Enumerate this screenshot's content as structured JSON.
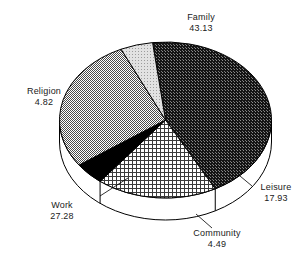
{
  "chart_data": {
    "type": "pie",
    "title": "",
    "subtitle": "",
    "xlabel": "",
    "ylabel": "",
    "legend_position": "none",
    "grid": false,
    "three_d": true,
    "labels_outside": true,
    "categories": [
      "Family",
      "Leisure",
      "Community",
      "Work",
      "Religion"
    ],
    "values": [
      43.13,
      17.93,
      4.49,
      27.28,
      4.82
    ],
    "slices": [
      {
        "label": "Family",
        "value": 43.13,
        "value_text": "43.13",
        "fill": "dark-dotted",
        "color": "#1c1c1c"
      },
      {
        "label": "Leisure",
        "value": 17.93,
        "value_text": "17.93",
        "fill": "fine-crosshatch",
        "color": "#ffffff"
      },
      {
        "label": "Community",
        "value": 4.49,
        "value_text": "4.49",
        "fill": "solid-black",
        "color": "#000000"
      },
      {
        "label": "Work",
        "value": 27.28,
        "value_text": "27.28",
        "fill": "gray-checker",
        "color": "#9a9a9a"
      },
      {
        "label": "Religion",
        "value": 4.82,
        "value_text": "4.82",
        "fill": "light-gray-dots",
        "color": "#d4d4d4"
      }
    ],
    "total": 97.65,
    "start_angle_deg": -97,
    "direction": "clockwise"
  },
  "labels": {
    "family": {
      "name": "Family",
      "value": "43.13"
    },
    "religion": {
      "name": "Religion",
      "value": "4.82"
    },
    "work": {
      "name": "Work",
      "value": "27.28"
    },
    "community": {
      "name": "Community",
      "value": "4.49"
    },
    "leisure": {
      "name": "Leisure",
      "value": "17.93"
    }
  },
  "style": {
    "background": "#ffffff",
    "outline": "#000000",
    "text_color": "#1a1a1a",
    "side_wall": "#ffffff"
  }
}
